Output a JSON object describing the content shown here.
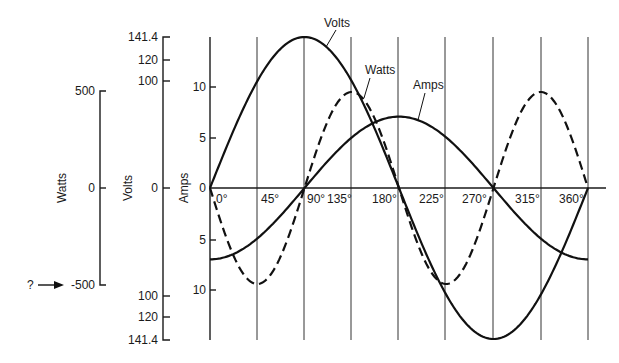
{
  "chart_data": {
    "type": "line",
    "title": "",
    "xlabel": "",
    "x": [
      0,
      45,
      90,
      135,
      180,
      225,
      270,
      315,
      360
    ],
    "x_tick_labels": [
      "0°",
      "45°",
      "90°",
      "135°",
      "180°",
      "225°",
      "270°",
      "315°",
      "360°"
    ],
    "series": [
      {
        "name": "Volts",
        "style": "solid",
        "formula": "141.4*sin(theta)",
        "values": [
          0,
          100,
          141.4,
          100,
          0,
          -100,
          -141.4,
          -100,
          0
        ]
      },
      {
        "name": "Amps",
        "style": "solid",
        "formula": "-7*cos(theta)",
        "values": [
          -7,
          -4.95,
          0,
          4.95,
          7,
          4.95,
          0,
          -4.95,
          -7
        ]
      },
      {
        "name": "Watts",
        "style": "dashed",
        "formula": "Volts*Amps",
        "values": [
          0,
          -495,
          0,
          495,
          0,
          -495,
          0,
          495,
          0
        ]
      }
    ],
    "axes": [
      {
        "label": "Watts",
        "ticks": [
          "500",
          "0",
          "-500"
        ],
        "range": [
          -500,
          500
        ]
      },
      {
        "label": "Volts",
        "ticks": [
          "141.4",
          "120",
          "100",
          "0",
          "100",
          "120",
          "141.4"
        ],
        "range": [
          -141.4,
          141.4
        ]
      },
      {
        "label": "Amps",
        "ticks": [
          "10",
          "5",
          "0",
          "5",
          "10"
        ],
        "range": [
          -12,
          12
        ]
      }
    ],
    "annotations": [
      {
        "text": "?",
        "target": "-500 Watts",
        "arrow": true
      }
    ],
    "grid": "vertical lines at each 45°"
  },
  "labels": {
    "watts_axis": "Watts",
    "volts_axis": "Volts",
    "amps_axis": "Amps",
    "volts_curve": "Volts",
    "watts_curve": "Watts",
    "amps_curve": "Amps",
    "question": "?",
    "watts_ticks": [
      "500",
      "0",
      "-500"
    ],
    "volts_ticks": [
      "141.4",
      "120",
      "100",
      "0",
      "100",
      "120",
      "141.4"
    ],
    "amps_ticks": [
      "10",
      "5",
      "0",
      "5",
      "10"
    ],
    "deg": [
      "0°",
      "45°",
      "90°",
      "135°",
      "180°",
      "225°",
      "270°",
      "315°",
      "360°"
    ]
  }
}
